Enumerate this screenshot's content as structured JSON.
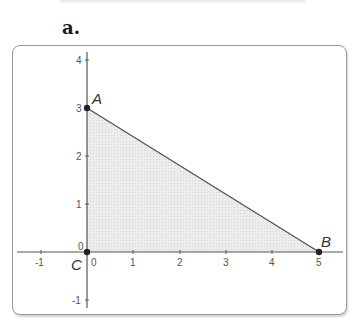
{
  "header": {
    "part_label": "a."
  },
  "figure": {
    "x_axis": {
      "ticks": [
        "-1",
        "1",
        "2",
        "3",
        "4",
        "5"
      ],
      "origin_label": "0"
    },
    "y_axis": {
      "ticks": [
        "4",
        "3",
        "2",
        "1",
        "0",
        "-1"
      ]
    },
    "points": [
      {
        "name": "A",
        "x": 0,
        "y": 3
      },
      {
        "name": "B",
        "x": 5,
        "y": 0
      },
      {
        "name": "C",
        "x": 0,
        "y": 0
      }
    ],
    "shaded_region": "triangle ABC",
    "colors": {
      "fill": "#e4e4e4",
      "line": "#555555",
      "point": "#222222",
      "frame": "#9a9a9a"
    }
  }
}
